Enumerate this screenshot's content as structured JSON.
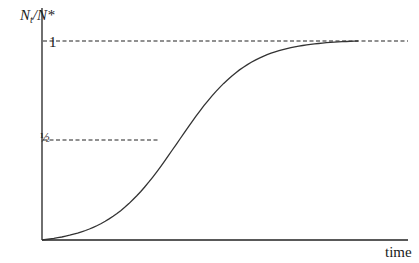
{
  "chart_data": {
    "type": "line",
    "title": "",
    "xlabel": "time",
    "ylabel": "Nt/N*",
    "ylabel_parts": {
      "main": "N",
      "sub": "t",
      "rest": "/N*"
    },
    "yticks": [
      {
        "label": "1",
        "value": 1.0
      },
      {
        "label": "½",
        "value": 0.5
      }
    ],
    "ylim": [
      0,
      1.15
    ],
    "grid": false,
    "reference_lines": [
      {
        "y": 1.0,
        "style": "dashed"
      },
      {
        "y": 0.5,
        "style": "dashed"
      }
    ],
    "series": [
      {
        "name": "logistic growth",
        "description": "Sigmoid curve starting at 0, inflecting at 1/2, approaching 1",
        "x": [
          0,
          0.05,
          0.1,
          0.15,
          0.2,
          0.25,
          0.3,
          0.35,
          0.4,
          0.45,
          0.5,
          0.55,
          0.6,
          0.65,
          0.7,
          0.75,
          0.8,
          0.85,
          0.9
        ],
        "values": [
          0.0,
          0.05,
          0.1,
          0.16,
          0.24,
          0.33,
          0.44,
          0.55,
          0.66,
          0.76,
          0.84,
          0.9,
          0.94,
          0.97,
          0.985,
          0.993,
          0.997,
          0.999,
          1.0
        ]
      }
    ]
  },
  "labels": {
    "y_main": "N",
    "y_sub": "t",
    "y_rest": "/N*",
    "tick_one": "1",
    "tick_half": "½",
    "x_axis": "time"
  }
}
